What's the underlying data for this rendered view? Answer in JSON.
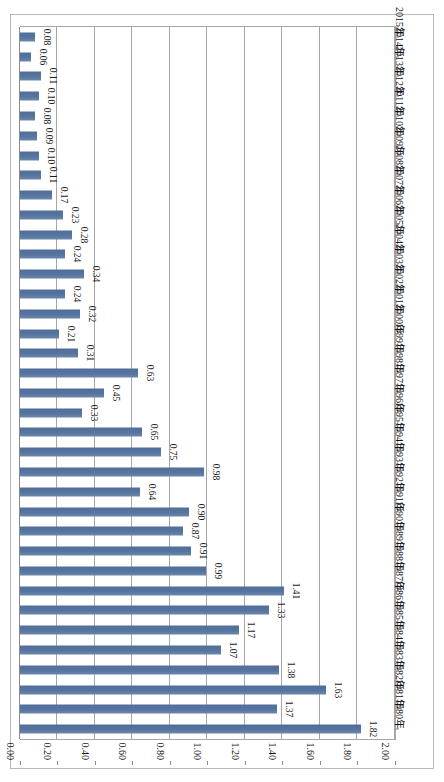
{
  "chart_data": {
    "type": "bar",
    "orientation": "horizontal",
    "title": "",
    "subtitle": "",
    "xlabel": "",
    "ylabel": "",
    "xlim": [
      0.0,
      2.0
    ],
    "x_tick_labels": [
      "2.00",
      "1.80",
      "1.60",
      "1.40",
      "1.20",
      "1.00",
      "0.80",
      "0.60",
      "0.40",
      "0.20",
      "0.00"
    ],
    "x_tick_values": [
      2.0,
      1.8,
      1.6,
      1.4,
      1.2,
      1.0,
      0.8,
      0.6,
      0.4,
      0.2,
      0.0
    ],
    "x_axis_direction": "reversed",
    "grid": true,
    "grid_axis": "x",
    "legend": "none",
    "legend_position": "none",
    "data_labels": true,
    "data_label_format": "0.00",
    "data_label_rotation": 90,
    "category_label_rotation": 90,
    "series_color": "#54739E",
    "gridline_color": "#A6A6A6",
    "plot_background": "#FFFFFF",
    "categories": [
      "1980年",
      "1981年",
      "1982年",
      "1983年",
      "1984年",
      "1985年",
      "1986年",
      "1987年",
      "1988年",
      "1989年",
      "1990年",
      "1991年",
      "1992年",
      "1993年",
      "1994年",
      "1995年",
      "1996年",
      "1997年",
      "1998年",
      "1999年",
      "2000年",
      "2001年",
      "2002年",
      "2003年",
      "2004年",
      "2005年",
      "2006年",
      "2007年",
      "2008年",
      "2009年",
      "2010年",
      "2011年",
      "2012年",
      "2013年",
      "2014年",
      "2015年"
    ],
    "values": [
      1.82,
      1.37,
      1.63,
      1.38,
      1.07,
      1.17,
      1.33,
      1.41,
      0.99,
      0.91,
      0.87,
      0.9,
      0.64,
      0.98,
      0.75,
      0.65,
      0.33,
      0.45,
      0.63,
      0.31,
      0.21,
      0.32,
      0.24,
      0.34,
      0.24,
      0.28,
      0.23,
      0.17,
      0.11,
      0.1,
      0.09,
      0.08,
      0.1,
      0.11,
      0.06,
      0.08
    ],
    "value_labels": [
      "1.82",
      "1.37",
      "1.63",
      "1.38",
      "1.07",
      "1.17",
      "1.33",
      "1.41",
      "0.99",
      "0.91",
      "0.87",
      "0.90",
      "0.64",
      "0.98",
      "0.75",
      "0.65",
      "0.33",
      "0.45",
      "0.63",
      "0.31",
      "0.21",
      "0.32",
      "0.24",
      "0.34",
      "0.24",
      "0.28",
      "0.23",
      "0.17",
      "0.11",
      "0.10",
      "0.09",
      "0.08",
      "0.10",
      "0.11",
      "0.06",
      "0.08"
    ],
    "series": [
      {
        "name": "",
        "values": [
          1.82,
          1.37,
          1.63,
          1.38,
          1.07,
          1.17,
          1.33,
          1.41,
          0.99,
          0.91,
          0.87,
          0.9,
          0.64,
          0.98,
          0.75,
          0.65,
          0.33,
          0.45,
          0.63,
          0.31,
          0.21,
          0.32,
          0.24,
          0.34,
          0.24,
          0.28,
          0.23,
          0.17,
          0.11,
          0.1,
          0.09,
          0.08,
          0.1,
          0.11,
          0.06,
          0.08
        ]
      }
    ]
  }
}
